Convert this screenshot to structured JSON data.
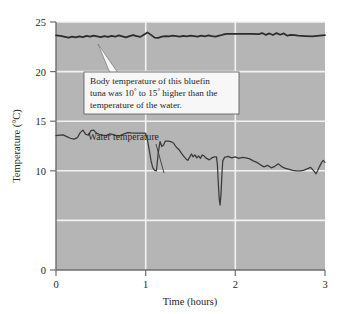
{
  "figure": {
    "background_color": "#ffffff",
    "plot_background_color": "#b5b5b5",
    "grid_color": "#f2f2f2",
    "axis_color": "#6e6e6e",
    "line_color": "#2b2b2b",
    "callout_box_fill": "#f7f7f7",
    "callout_box_border": "#555555"
  },
  "axes": {
    "y_title": "Temperature (°C)",
    "x_title": "Time (hours)",
    "y_ticks": [
      "0",
      "10",
      "15",
      "20",
      "25"
    ],
    "x_ticks": [
      "0",
      "1",
      "2",
      "3"
    ]
  },
  "annotations": {
    "callout": {
      "line1_a": "Body temperature of this bluefin",
      "line2_a": "tuna was 10",
      "line2_sup1": "°",
      "line2_b": " to 15",
      "line2_sup2": "°",
      "line2_c": " higher than the",
      "line3": "temperature of the water."
    },
    "water_label": "Water temperature"
  },
  "chart_data": {
    "type": "line",
    "title": "",
    "xlabel": "Time (hours)",
    "ylabel": "Temperature (°C)",
    "xlim": [
      0,
      3
    ],
    "ylim": [
      0,
      25
    ],
    "yticks": [
      0,
      10,
      15,
      20,
      25
    ],
    "xticks": [
      0,
      1,
      2,
      3
    ],
    "grid": true,
    "grid_orientation": "both",
    "legend": "inline-annotations",
    "series": [
      {
        "name": "Body temperature",
        "color": "#2b2b2b",
        "x": [
          0.0,
          0.05,
          0.1,
          0.14,
          0.18,
          0.22,
          0.26,
          0.3,
          0.34,
          0.38,
          0.42,
          0.46,
          0.5,
          0.54,
          0.58,
          0.62,
          0.66,
          0.7,
          0.74,
          0.78,
          0.82,
          0.86,
          0.9,
          0.94,
          0.98,
          1.02,
          1.06,
          1.1,
          1.14,
          1.18,
          1.22,
          1.26,
          1.3,
          1.34,
          1.38,
          1.42,
          1.46,
          1.5,
          1.54,
          1.58,
          1.62,
          1.66,
          1.7,
          1.74,
          1.78,
          1.82,
          1.86,
          1.9,
          1.94,
          1.98,
          2.02,
          2.1,
          2.18,
          2.26,
          2.3,
          2.34,
          2.38,
          2.42,
          2.46,
          2.5,
          2.54,
          2.58,
          2.62,
          2.66,
          2.7,
          2.78,
          2.86,
          2.94,
          3.0
        ],
        "values": [
          23.65,
          23.6,
          23.5,
          23.42,
          23.52,
          23.45,
          23.55,
          23.48,
          23.6,
          23.52,
          23.62,
          23.55,
          23.48,
          23.58,
          23.5,
          23.6,
          23.52,
          23.65,
          23.55,
          23.45,
          23.58,
          23.68,
          23.58,
          23.5,
          23.72,
          23.95,
          23.7,
          23.42,
          23.4,
          23.52,
          23.58,
          23.55,
          23.62,
          23.58,
          23.52,
          23.6,
          23.55,
          23.62,
          23.58,
          23.52,
          23.62,
          23.55,
          23.65,
          23.58,
          23.52,
          23.62,
          23.72,
          23.8,
          23.8,
          23.8,
          23.8,
          23.8,
          23.8,
          23.78,
          23.88,
          23.7,
          23.85,
          23.68,
          23.88,
          23.72,
          23.85,
          23.62,
          23.7,
          23.68,
          23.62,
          23.58,
          23.55,
          23.62,
          23.68
        ]
      },
      {
        "name": "Water temperature",
        "color": "#2b2b2b",
        "x": [
          0.0,
          0.04,
          0.08,
          0.12,
          0.16,
          0.2,
          0.24,
          0.27,
          0.3,
          0.33,
          0.36,
          0.39,
          0.42,
          0.45,
          0.48,
          0.52,
          0.56,
          0.6,
          0.64,
          0.68,
          0.72,
          0.76,
          0.8,
          0.84,
          0.88,
          0.92,
          0.96,
          0.99,
          1.0,
          1.02,
          1.04,
          1.06,
          1.08,
          1.1,
          1.12,
          1.14,
          1.16,
          1.18,
          1.2,
          1.22,
          1.25,
          1.28,
          1.31,
          1.34,
          1.37,
          1.4,
          1.43,
          1.45,
          1.47,
          1.49,
          1.51,
          1.53,
          1.55,
          1.57,
          1.59,
          1.61,
          1.63,
          1.65,
          1.67,
          1.69,
          1.71,
          1.73,
          1.75,
          1.77,
          1.79,
          1.8,
          1.81,
          1.82,
          1.83,
          1.84,
          1.85,
          1.86,
          1.88,
          1.92,
          1.96,
          2.0,
          2.04,
          2.08,
          2.12,
          2.16,
          2.2,
          2.24,
          2.28,
          2.32,
          2.36,
          2.4,
          2.44,
          2.48,
          2.52,
          2.56,
          2.6,
          2.64,
          2.68,
          2.72,
          2.76,
          2.8,
          2.84,
          2.86,
          2.88,
          2.9,
          2.92,
          2.94,
          2.96,
          2.98,
          3.0
        ],
        "values": [
          13.55,
          13.6,
          13.62,
          13.45,
          13.28,
          13.2,
          13.35,
          13.85,
          14.1,
          13.7,
          13.58,
          14.05,
          14.1,
          13.8,
          13.68,
          13.6,
          13.55,
          13.72,
          13.65,
          13.52,
          13.58,
          13.72,
          13.85,
          13.82,
          13.8,
          13.8,
          13.8,
          13.8,
          13.78,
          13.1,
          12.1,
          11.0,
          10.3,
          10.05,
          10.0,
          11.8,
          12.95,
          12.45,
          12.6,
          13.0,
          13.0,
          12.95,
          12.8,
          12.4,
          12.15,
          11.75,
          11.4,
          11.2,
          11.05,
          11.35,
          11.7,
          11.4,
          11.6,
          11.3,
          11.5,
          11.25,
          11.6,
          11.5,
          11.3,
          11.2,
          11.1,
          11.25,
          11.35,
          11.4,
          11.4,
          10.6,
          8.8,
          7.2,
          6.55,
          7.6,
          9.6,
          11.0,
          11.35,
          11.45,
          11.3,
          11.4,
          11.25,
          11.35,
          11.3,
          11.2,
          11.0,
          10.85,
          10.6,
          10.4,
          10.55,
          10.3,
          10.45,
          10.7,
          10.4,
          10.25,
          10.15,
          10.05,
          10.0,
          10.0,
          10.05,
          10.2,
          10.35,
          10.15,
          9.95,
          9.7,
          10.05,
          10.45,
          10.8,
          11.05,
          10.85
        ]
      }
    ],
    "annotations": [
      {
        "text": "Body temperature of this bluefin tuna was 10° to 15° higher than the temperature of the water.",
        "points_to": {
          "x": 0.55,
          "y": 23.0
        }
      },
      {
        "text": "Water temperature",
        "points_to": {
          "x": 1.23,
          "y": 13.0
        }
      }
    ]
  }
}
